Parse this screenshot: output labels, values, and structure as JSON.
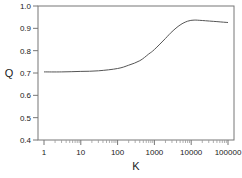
{
  "chart_data": {
    "type": "line",
    "title": "",
    "xlabel": "K",
    "ylabel": "Q",
    "xscale": "log",
    "xlim": [
      0.85,
      150000
    ],
    "ylim": [
      0.4,
      1.0
    ],
    "grid": false,
    "legend": null,
    "x_ticks": [
      1,
      10,
      100,
      1000,
      10000,
      100000
    ],
    "x_tick_labels": [
      "1",
      "10",
      "100",
      "1000",
      "10000",
      "100000"
    ],
    "y_ticks": [
      0.4,
      0.5,
      0.6,
      0.7,
      0.8,
      0.9,
      1.0
    ],
    "y_tick_labels": [
      "0.4",
      "0.5",
      "0.6",
      "0.7",
      "0.8",
      "0.9",
      "1.0"
    ],
    "series": [
      {
        "name": "Q",
        "color": "#555555",
        "x": [
          1,
          3,
          10,
          30,
          100,
          200,
          400,
          700,
          1000,
          2000,
          3000,
          5000,
          8000,
          12000,
          20000,
          50000,
          100000
        ],
        "y": [
          0.705,
          0.705,
          0.707,
          0.71,
          0.72,
          0.735,
          0.755,
          0.785,
          0.805,
          0.855,
          0.885,
          0.915,
          0.932,
          0.937,
          0.935,
          0.93,
          0.926
        ]
      }
    ]
  }
}
